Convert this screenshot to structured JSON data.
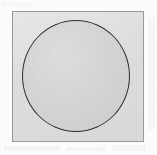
{
  "figure": {
    "title": "",
    "caption": "",
    "canvas": {
      "width": 157,
      "height": 155,
      "background_color": "#fdfdfd"
    },
    "shapes": [
      {
        "name": "square-frame",
        "type": "square",
        "x": 12,
        "y": 11,
        "width": 132,
        "height": 131,
        "stroke_color": "#9b9b9b",
        "stroke_width": 1,
        "fill_color": "#dededd",
        "label": ""
      },
      {
        "name": "inscribed-circle",
        "type": "circle",
        "center_x": 75,
        "center_y": 75,
        "width": 108,
        "height": 112,
        "radius": 54,
        "stroke_color": "#2f2f2f",
        "stroke_width": 1.2,
        "fill_color": "#d3d3d2",
        "label": ""
      }
    ],
    "annotations": [],
    "labels": []
  }
}
